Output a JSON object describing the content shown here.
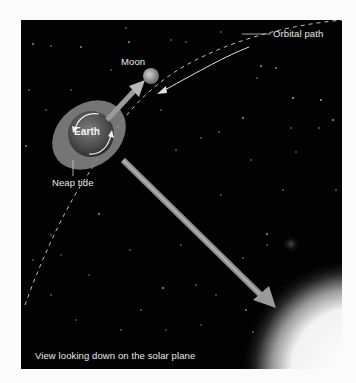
{
  "diagram": {
    "title": "Neap tide",
    "labels": {
      "moon": "Moon",
      "orbital_path": "Orbital path",
      "earth": "Earth",
      "neap_tide": "Neap tide",
      "caption": "View looking down on the solar plane"
    },
    "elements": [
      {
        "name": "Earth",
        "type": "planet",
        "note": "surrounded by grey tidal bulge ellipse, rotation arrows"
      },
      {
        "name": "Moon",
        "type": "moon"
      },
      {
        "name": "Sun",
        "type": "star",
        "position": "bottom-right corner, glowing"
      },
      {
        "name": "Orbital path",
        "type": "dashed-curve"
      },
      {
        "name": "Moon gravitational pull",
        "type": "arrow",
        "from": "Earth",
        "to": "Moon"
      },
      {
        "name": "Sun gravitational pull",
        "type": "arrow",
        "from": "Earth",
        "to": "Sun"
      },
      {
        "name": "Moon orbit direction",
        "type": "arrow"
      }
    ],
    "colors": {
      "background": "#020202",
      "page": "#fbfbfb",
      "arrow": "#9a9a9a",
      "bulge": "#8c8c8c",
      "text": "#e8e8e8",
      "sun": "#ffffff"
    }
  }
}
